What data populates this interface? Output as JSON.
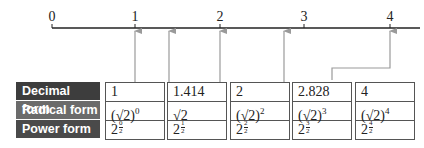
{
  "number_line": {
    "ticks": [
      {
        "label": "0",
        "x": 52
      },
      {
        "label": "1",
        "x": 135
      },
      {
        "label": "2",
        "x": 220
      },
      {
        "label": "3",
        "x": 304
      },
      {
        "label": "4",
        "x": 390
      }
    ],
    "arrow_values": [
      "1",
      "1.414",
      "2",
      "2.828",
      "4"
    ]
  },
  "table": {
    "row_labels": [
      "Decimal form",
      "Radical form",
      "Power form"
    ],
    "columns": [
      {
        "decimal": "1",
        "radical_base": "(√2)",
        "radical_exp": "0",
        "power_base": "2",
        "power_num": "0",
        "power_den": "2"
      },
      {
        "decimal": "1.414",
        "radical_base": "√2",
        "radical_exp": "",
        "power_base": "2",
        "power_num": "1",
        "power_den": "2"
      },
      {
        "decimal": "2",
        "radical_base": "(√2)",
        "radical_exp": "2",
        "power_base": "2",
        "power_num": "2",
        "power_den": "2"
      },
      {
        "decimal": "2.828",
        "radical_base": "(√2)",
        "radical_exp": "3",
        "power_base": "2",
        "power_num": "3",
        "power_den": "2"
      },
      {
        "decimal": "4",
        "radical_base": "(√2)",
        "radical_exp": "4",
        "power_base": "2",
        "power_num": "4",
        "power_den": "2"
      }
    ]
  },
  "colors": {
    "label_dark": "#3d3d3d",
    "label_mid": "#6b6b6b",
    "arrow": "#9a9a9a",
    "line": "#222222"
  }
}
